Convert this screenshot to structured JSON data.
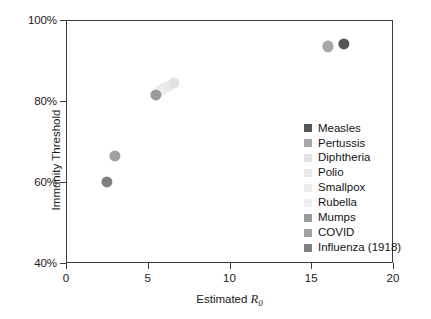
{
  "chart_data": {
    "type": "scatter",
    "title": "",
    "xlabel": "Estimated R0",
    "xlabel_parts": {
      "prefix": "Estimated ",
      "symbol": "R",
      "subscript": "0"
    },
    "ylabel": "Immunity Threshold",
    "xlim": [
      0,
      20
    ],
    "ylim": [
      40,
      100
    ],
    "xticks": [
      "0",
      "5",
      "10",
      "15",
      "20"
    ],
    "xtick_values": [
      0,
      5,
      10,
      15,
      20
    ],
    "yticks": [
      "40%",
      "60%",
      "80%",
      "100%"
    ],
    "ytick_values": [
      40,
      60,
      80,
      100
    ],
    "grid": false,
    "legend_position": "inside-right",
    "points": [
      {
        "name": "Measles",
        "x": 17.0,
        "y": 94.0,
        "color": "#555555",
        "radius": 5.6
      },
      {
        "name": "Pertussis",
        "x": 16.0,
        "y": 93.5,
        "color": "#a8a8a8",
        "radius": 5.6
      },
      {
        "name": "Diphtheria",
        "x": 6.6,
        "y": 84.5,
        "color": "#e2e2e2",
        "radius": 5.6
      },
      {
        "name": "Polio",
        "x": 6.3,
        "y": 83.8,
        "color": "#e8e8e8",
        "radius": 5.6
      },
      {
        "name": "Smallpox",
        "x": 6.0,
        "y": 83.2,
        "color": "#ececec",
        "radius": 5.6
      },
      {
        "name": "Rubella",
        "x": 5.8,
        "y": 82.6,
        "color": "#efefef",
        "radius": 5.6
      },
      {
        "name": "Mumps",
        "x": 5.5,
        "y": 81.5,
        "color": "#9a9a9a",
        "radius": 5.6
      },
      {
        "name": "COVID",
        "x": 3.0,
        "y": 66.5,
        "color": "#a0a0a0",
        "radius": 5.6
      },
      {
        "name": "Influenza (1918)",
        "x": 2.5,
        "y": 60.0,
        "color": "#808080",
        "radius": 5.6
      }
    ],
    "legend": [
      {
        "label": "Measles",
        "color": "#555555"
      },
      {
        "label": "Pertussis",
        "color": "#a8a8a8"
      },
      {
        "label": "Diphtheria",
        "color": "#e2e2e2"
      },
      {
        "label": "Polio",
        "color": "#e8e8e8"
      },
      {
        "label": "Smallpox",
        "color": "#ececec"
      },
      {
        "label": "Rubella",
        "color": "#efefef"
      },
      {
        "label": "Mumps",
        "color": "#9a9a9a"
      },
      {
        "label": "COVID",
        "color": "#a0a0a0"
      },
      {
        "label": "Influenza (1918)",
        "color": "#808080"
      }
    ],
    "axis_color": "#3b3b3b",
    "background": "#ffffff"
  }
}
